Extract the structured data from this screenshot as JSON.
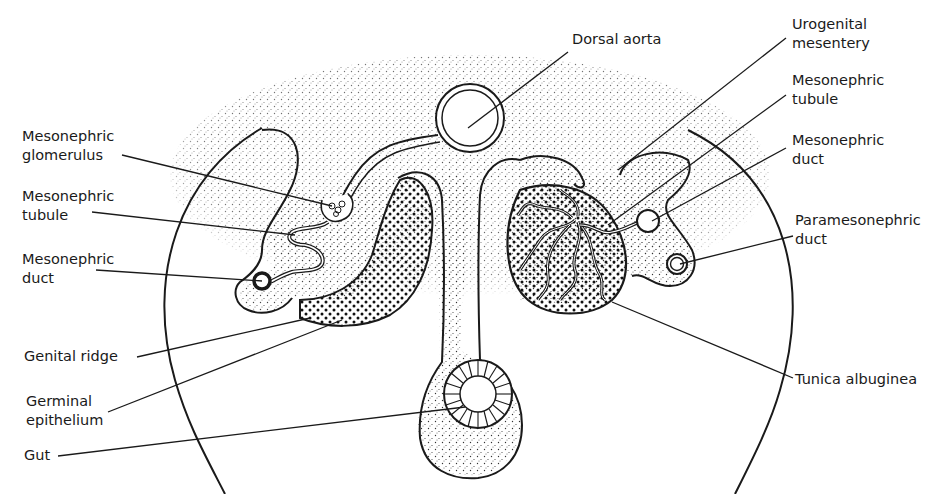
{
  "figure": {
    "labels_left": [
      {
        "id": "mesonephric-glomerulus",
        "lines": [
          "Mesonephric",
          "glomerulus"
        ]
      },
      {
        "id": "mesonephric-tubule-left",
        "lines": [
          "Mesonephric",
          "tubule"
        ]
      },
      {
        "id": "mesonephric-duct-left",
        "lines": [
          "Mesonephric",
          "duct"
        ]
      },
      {
        "id": "genital-ridge",
        "lines": [
          "Genital ridge"
        ]
      },
      {
        "id": "germinal-epithelium",
        "lines": [
          "Germinal",
          "epithelium"
        ]
      },
      {
        "id": "gut",
        "lines": [
          "Gut"
        ]
      }
    ],
    "labels_top": [
      {
        "id": "dorsal-aorta",
        "lines": [
          "Dorsal aorta"
        ]
      }
    ],
    "labels_right": [
      {
        "id": "urogenital-mesentery",
        "lines": [
          "Urogenital",
          "mesentery"
        ]
      },
      {
        "id": "mesonephric-tubule-right",
        "lines": [
          "Mesonephric",
          "tubule"
        ]
      },
      {
        "id": "mesonephric-duct-right",
        "lines": [
          "Mesonephric",
          "duct"
        ]
      },
      {
        "id": "paramesonephric-duct",
        "lines": [
          "Paramesonephric",
          "duct"
        ]
      },
      {
        "id": "tunica-albuginea",
        "lines": [
          "Tunica albuginea"
        ]
      }
    ],
    "colors": {
      "ink": "#1a1a1a",
      "background": "#ffffff"
    }
  }
}
